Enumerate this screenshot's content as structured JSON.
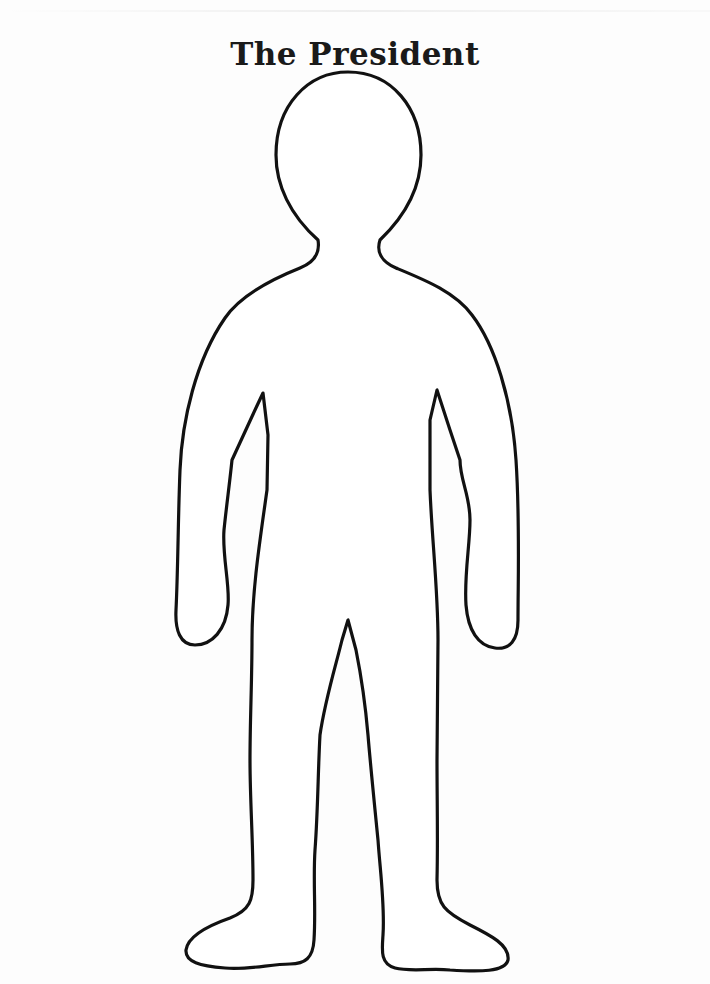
{
  "page": {
    "title": "The President"
  },
  "figure": {
    "stroke_color": "#111111",
    "fill_color": "#ffffff"
  }
}
